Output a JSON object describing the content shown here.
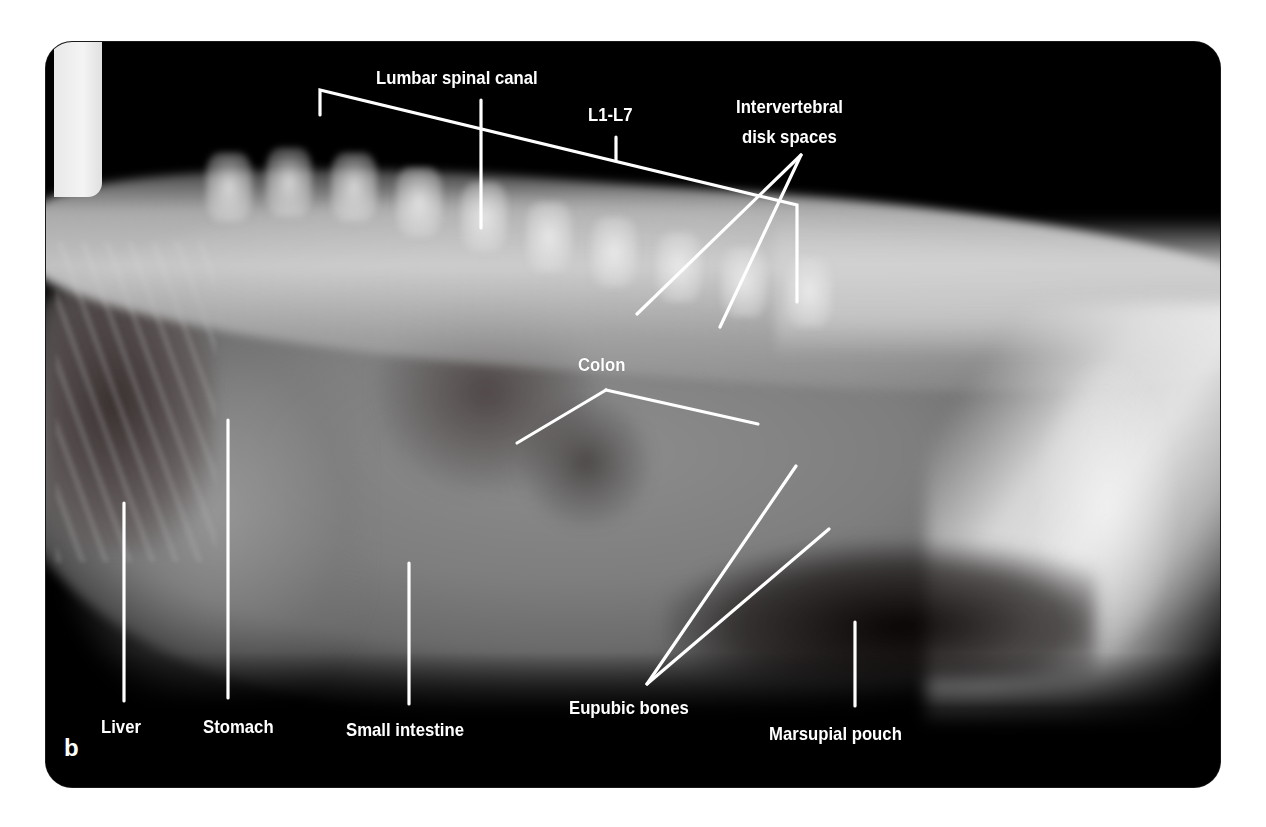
{
  "figure": {
    "panel_letter": "b",
    "colors": {
      "background": "#000000",
      "page": "#ffffff",
      "annotation": "#ffffff"
    }
  },
  "labels": {
    "lumbar_spinal_canal": "Lumbar spinal canal",
    "l1_l7": "L1-L7",
    "intervertebral_line1": "Intervertebral",
    "intervertebral_line2": "disk spaces",
    "colon": "Colon",
    "liver": "Liver",
    "stomach": "Stomach",
    "small_intestine": "Small intestine",
    "eupubic_bones": "Eupubic bones",
    "marsupial_pouch": "Marsupial pouch"
  },
  "leader_lines": [
    {
      "id": "lumbar-bracket",
      "points": [
        [
          320,
          115
        ],
        [
          320,
          90
        ],
        [
          797,
          205
        ],
        [
          797,
          302
        ]
      ]
    },
    {
      "id": "l1-l7-tick",
      "points": [
        [
          616,
          160
        ],
        [
          616,
          137
        ]
      ]
    },
    {
      "id": "lumbar-canal-pointer",
      "points": [
        [
          481,
          100
        ],
        [
          481,
          228
        ]
      ]
    },
    {
      "id": "disk-space-1",
      "points": [
        [
          801,
          155
        ],
        [
          637,
          314
        ]
      ]
    },
    {
      "id": "disk-space-2",
      "points": [
        [
          801,
          155
        ],
        [
          720,
          327
        ]
      ]
    },
    {
      "id": "colon-left",
      "points": [
        [
          606,
          390
        ],
        [
          517,
          443
        ]
      ]
    },
    {
      "id": "colon-right",
      "points": [
        [
          606,
          390
        ],
        [
          758,
          424
        ]
      ]
    },
    {
      "id": "liver-pointer",
      "points": [
        [
          124,
          503
        ],
        [
          124,
          701
        ]
      ]
    },
    {
      "id": "stomach-pointer",
      "points": [
        [
          228,
          420
        ],
        [
          228,
          698
        ]
      ]
    },
    {
      "id": "small-intestine-pointer",
      "points": [
        [
          409,
          563
        ],
        [
          409,
          704
        ]
      ]
    },
    {
      "id": "eupubic-1",
      "points": [
        [
          647,
          684
        ],
        [
          796,
          466
        ]
      ]
    },
    {
      "id": "eupubic-2",
      "points": [
        [
          647,
          684
        ],
        [
          829,
          529
        ]
      ]
    },
    {
      "id": "marsupial-pouch-pointer",
      "points": [
        [
          855,
          622
        ],
        [
          855,
          706
        ]
      ]
    }
  ]
}
